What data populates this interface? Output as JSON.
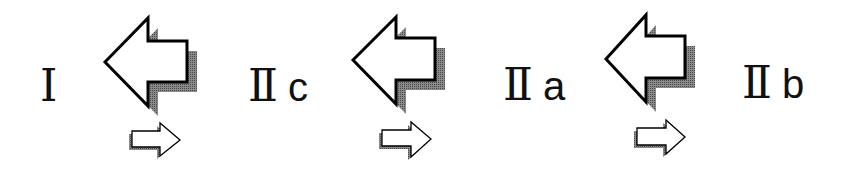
{
  "diagram": {
    "colors": {
      "outline": "#000000",
      "fill": "#ffffff",
      "shadow": "#6e6e6e",
      "text": "#111111"
    },
    "nodes": [
      {
        "id": "I",
        "roman": "Ⅰ",
        "suffix": ""
      },
      {
        "id": "IIc",
        "roman": "Ⅱ",
        "suffix": "c"
      },
      {
        "id": "IIa",
        "roman": "Ⅱ",
        "suffix": "a"
      },
      {
        "id": "IIb",
        "roman": "Ⅱ",
        "suffix": "b"
      }
    ],
    "transitions": [
      {
        "from": "IIc",
        "to": "I",
        "major_arrow": "left-arrow-icon",
        "minor_arrow": "right-arrow-icon"
      },
      {
        "from": "IIa",
        "to": "IIc",
        "major_arrow": "left-arrow-icon",
        "minor_arrow": "right-arrow-icon"
      },
      {
        "from": "IIb",
        "to": "IIa",
        "major_arrow": "left-arrow-icon",
        "minor_arrow": "right-arrow-icon"
      }
    ]
  }
}
